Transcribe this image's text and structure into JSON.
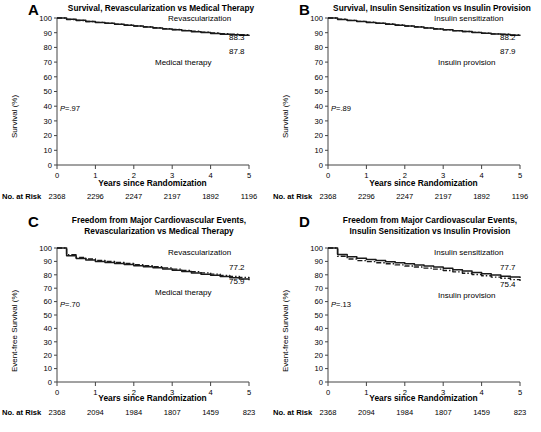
{
  "figure": {
    "xlabel": "Years since Randomization",
    "risk_label": "No. at Risk",
    "x_ticks": [
      "0",
      "1",
      "2",
      "3",
      "4",
      "5"
    ],
    "y_ticks": [
      "0",
      "10",
      "20",
      "30",
      "40",
      "50",
      "60",
      "70",
      "80",
      "90",
      "100"
    ]
  },
  "chart_data": [
    {
      "type": "line",
      "panel": "A",
      "letter": "A",
      "title": "Survival, Revascularization vs Medical Therapy",
      "xlabel": "Years since Randomization",
      "ylabel": "Survival (%)",
      "xlim": [
        0,
        5
      ],
      "ylim": [
        0,
        100
      ],
      "grid": false,
      "pvalue": "P=.97",
      "pvalue_prefix": "P",
      "pvalue_suffix": "=.97",
      "legend_position": "inline-right",
      "series": [
        {
          "name": "Revascularization",
          "style": "dash-dot",
          "endpoint_label": "88.3",
          "x": [
            0,
            0.25,
            0.5,
            0.75,
            1,
            1.25,
            1.5,
            1.75,
            2,
            2.25,
            2.5,
            2.75,
            3,
            3.25,
            3.5,
            3.75,
            4,
            4.25,
            4.5,
            4.75,
            5
          ],
          "values": [
            100,
            99.0,
            98.3,
            97.6,
            97.0,
            96.4,
            95.8,
            95.2,
            94.6,
            94.0,
            93.4,
            92.8,
            92.2,
            91.6,
            91.0,
            90.4,
            89.9,
            89.4,
            89.0,
            88.6,
            88.3
          ]
        },
        {
          "name": "Medical therapy",
          "style": "solid",
          "endpoint_label": "87.8",
          "x": [
            0,
            0.25,
            0.5,
            0.75,
            1,
            1.25,
            1.5,
            1.75,
            2,
            2.25,
            2.5,
            2.75,
            3,
            3.25,
            3.5,
            3.75,
            4,
            4.25,
            4.5,
            4.75,
            5
          ],
          "values": [
            100,
            99.1,
            98.4,
            97.7,
            97.0,
            96.4,
            95.8,
            95.1,
            94.5,
            93.9,
            93.2,
            92.6,
            92.0,
            91.3,
            90.7,
            90.1,
            89.5,
            89.0,
            88.6,
            88.2,
            87.8
          ]
        }
      ],
      "risk_counts": [
        2368,
        2296,
        2247,
        2197,
        1892,
        1196
      ]
    },
    {
      "type": "line",
      "panel": "B",
      "letter": "B",
      "title": "Survival, Insulin Sensitization vs Insulin Provision",
      "xlabel": "Years since Randomization",
      "ylabel": "Survival (%)",
      "xlim": [
        0,
        5
      ],
      "ylim": [
        0,
        100
      ],
      "grid": false,
      "pvalue": "P=.89",
      "pvalue_prefix": "P",
      "pvalue_suffix": "=.89",
      "legend_position": "inline-right",
      "series": [
        {
          "name": "Insulin sensitization",
          "style": "dash-dot",
          "endpoint_label": "88.2",
          "x": [
            0,
            0.25,
            0.5,
            0.75,
            1,
            1.25,
            1.5,
            1.75,
            2,
            2.25,
            2.5,
            2.75,
            3,
            3.25,
            3.5,
            3.75,
            4,
            4.25,
            4.5,
            4.75,
            5
          ],
          "values": [
            100,
            99.1,
            98.4,
            97.7,
            97.1,
            96.5,
            95.9,
            95.3,
            94.6,
            94.0,
            93.3,
            92.7,
            92.0,
            91.4,
            90.8,
            90.2,
            89.7,
            89.2,
            88.9,
            88.5,
            88.2
          ]
        },
        {
          "name": "Insulin provision",
          "style": "solid",
          "endpoint_label": "87.9",
          "x": [
            0,
            0.25,
            0.5,
            0.75,
            1,
            1.25,
            1.5,
            1.75,
            2,
            2.25,
            2.5,
            2.75,
            3,
            3.25,
            3.5,
            3.75,
            4,
            4.25,
            4.5,
            4.75,
            5
          ],
          "values": [
            100,
            99.0,
            98.3,
            97.6,
            97.0,
            96.4,
            95.7,
            95.1,
            94.5,
            93.9,
            93.2,
            92.6,
            92.0,
            91.4,
            90.8,
            90.2,
            89.6,
            89.1,
            88.7,
            88.3,
            87.9
          ]
        }
      ],
      "risk_counts": [
        2368,
        2296,
        2247,
        2197,
        1892,
        1196
      ]
    },
    {
      "type": "line",
      "panel": "C",
      "letter": "C",
      "title": "Freedom from Major Cardiovascular Events, Revascularization vs Medical Therapy",
      "title_line1": "Freedom from Major Cardiovascular Events,",
      "title_line2": "Revascularization vs Medical Therapy",
      "xlabel": "Years since Randomization",
      "ylabel": "Event-free Survival (%)",
      "xlim": [
        0,
        5
      ],
      "ylim": [
        0,
        100
      ],
      "grid": false,
      "pvalue": "P=.70",
      "pvalue_prefix": "P",
      "pvalue_suffix": "=.70",
      "legend_position": "inline-right",
      "series": [
        {
          "name": "Revascularization",
          "style": "dash-dot",
          "endpoint_label": "77.2",
          "x": [
            0,
            0.25,
            0.5,
            0.75,
            1,
            1.25,
            1.5,
            1.75,
            2,
            2.25,
            2.5,
            2.75,
            3,
            3.25,
            3.5,
            3.75,
            4,
            4.25,
            4.5,
            4.75,
            5
          ],
          "values": [
            100,
            95.0,
            93.0,
            91.8,
            90.8,
            90.0,
            89.2,
            88.4,
            87.6,
            86.8,
            86.0,
            85.2,
            84.2,
            83.2,
            82.3,
            81.4,
            80.5,
            79.6,
            78.8,
            78.0,
            77.2
          ]
        },
        {
          "name": "Medical therapy",
          "style": "solid",
          "endpoint_label": "75.9",
          "x": [
            0,
            0.25,
            0.5,
            0.75,
            1,
            1.25,
            1.5,
            1.75,
            2,
            2.25,
            2.5,
            2.75,
            3,
            3.25,
            3.5,
            3.75,
            4,
            4.25,
            4.5,
            4.75,
            5
          ],
          "values": [
            100,
            94.2,
            92.2,
            91.0,
            90.0,
            89.2,
            88.4,
            87.6,
            86.8,
            86.0,
            85.2,
            84.4,
            83.4,
            82.4,
            81.4,
            80.5,
            79.6,
            78.7,
            77.8,
            76.9,
            75.9
          ]
        }
      ],
      "risk_counts": [
        2368,
        2094,
        1984,
        1807,
        1459,
        823
      ]
    },
    {
      "type": "line",
      "panel": "D",
      "letter": "D",
      "title": "Freedom from Major Cardiovascular Events, Insulin Sensitization vs Insulin Provision",
      "title_line1": "Freedom from Major Cardiovascular Events,",
      "title_line2": "Insulin Sensitization vs Insulin Provision",
      "xlabel": "Years since Randomization",
      "ylabel": "Event-free Survival (%)",
      "xlim": [
        0,
        5
      ],
      "ylim": [
        0,
        100
      ],
      "grid": false,
      "pvalue": "P=.13",
      "pvalue_prefix": "P",
      "pvalue_suffix": "=.13",
      "legend_position": "inline-right",
      "series": [
        {
          "name": "Insulin sensitization",
          "style": "solid",
          "endpoint_label": "77.7",
          "x": [
            0,
            0.25,
            0.5,
            0.75,
            1,
            1.25,
            1.5,
            1.75,
            2,
            2.25,
            2.5,
            2.75,
            3,
            3.25,
            3.5,
            3.75,
            4,
            4.25,
            4.5,
            4.75,
            5
          ],
          "values": [
            100,
            95.2,
            93.4,
            92.3,
            91.4,
            90.6,
            89.8,
            89.0,
            88.2,
            87.4,
            86.6,
            85.8,
            84.8,
            83.8,
            82.8,
            81.8,
            80.8,
            79.9,
            79.0,
            78.3,
            77.7
          ]
        },
        {
          "name": "Insulin provision",
          "style": "dash-dot",
          "endpoint_label": "75.4",
          "x": [
            0,
            0.25,
            0.5,
            0.75,
            1,
            1.25,
            1.5,
            1.75,
            2,
            2.25,
            2.5,
            2.75,
            3,
            3.25,
            3.5,
            3.75,
            4,
            4.25,
            4.5,
            4.75,
            5
          ],
          "values": [
            100,
            93.8,
            91.8,
            90.6,
            89.8,
            89.0,
            88.2,
            87.4,
            86.6,
            85.8,
            85.0,
            84.2,
            83.2,
            82.2,
            81.2,
            80.2,
            79.3,
            78.3,
            77.4,
            76.4,
            75.4
          ]
        }
      ],
      "risk_counts": [
        2368,
        2094,
        1984,
        1807,
        1459,
        823
      ]
    }
  ]
}
